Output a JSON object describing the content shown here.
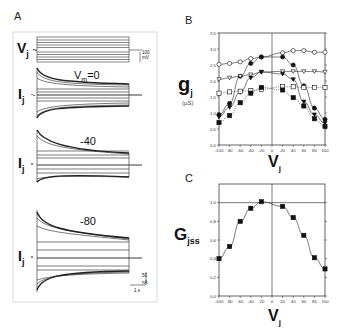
{
  "panels": {
    "A": {
      "letter": "A",
      "voltage_label": "V",
      "voltage_sub": "j",
      "current_label": "I",
      "current_sub": "j",
      "voltage_scale": {
        "value": "100",
        "unit": "mV"
      },
      "current_scale": {
        "value": "50",
        "unit": "nA"
      },
      "time_scale": "1 s",
      "traces": [
        {
          "vm_label": "V",
          "vm_sub": "m",
          "vm_value": "=0"
        },
        {
          "vm_value": "-40"
        },
        {
          "vm_value": "-80"
        }
      ]
    },
    "B": {
      "letter": "B",
      "ylabel_main": "g",
      "ylabel_sub": "j",
      "ylabel_unit": "(µS)",
      "xlabel_main": "V",
      "xlabel_sub": "j"
    },
    "C": {
      "letter": "C",
      "ylabel_main": "G",
      "ylabel_sub": "jss",
      "xlabel_main": "V",
      "xlabel_sub": "j"
    }
  },
  "chart_data": [
    {
      "panel": "A",
      "type": "line",
      "title": "Junctional current traces at Vm = 0, -40, -80 mV",
      "description": "Voltage step protocol (Vj) and resulting junctional current (Ij) families showing time-dependent decay at large transjunctional voltages",
      "annotations": [
        "Vm=0",
        "-40",
        "-80"
      ],
      "scale_bars": {
        "voltage": "100 mV",
        "current": "50 nA",
        "time": "1 s"
      }
    },
    {
      "panel": "B",
      "type": "scatter",
      "xlabel": "Vj",
      "ylabel": "gj (µS)",
      "xlim": [
        -100,
        100
      ],
      "ylim": [
        0.0,
        3.5
      ],
      "x_ticks": [
        -100,
        -80,
        -60,
        -40,
        -20,
        0,
        20,
        40,
        60,
        80,
        100
      ],
      "y_ticks": [
        "0,0",
        "0,5",
        "1,0",
        "1,5",
        "2,0",
        "2,5",
        "3,0",
        "3,5"
      ],
      "series": [
        {
          "name": "open circles (instantaneous)",
          "marker": "circle-open",
          "line": "solid",
          "x": [
            -100,
            -80,
            -60,
            -40,
            -20,
            20,
            40,
            60,
            80,
            100
          ],
          "y": [
            2.52,
            2.55,
            2.6,
            2.7,
            2.75,
            2.88,
            2.95,
            2.95,
            2.9,
            2.9
          ]
        },
        {
          "name": "filled circles (steady state)",
          "marker": "circle-filled",
          "line": "solid",
          "x": [
            -100,
            -80,
            -60,
            -40,
            -20,
            20,
            40,
            60,
            80,
            100
          ],
          "y": [
            0.95,
            1.3,
            2.15,
            2.55,
            2.75,
            2.75,
            2.5,
            1.85,
            1.15,
            0.8
          ]
        },
        {
          "name": "open triangles (instantaneous)",
          "marker": "triangle-open",
          "line": "solid",
          "x": [
            -100,
            -80,
            -60,
            -40,
            -20,
            20,
            40,
            60,
            80,
            100
          ],
          "y": [
            2.05,
            2.1,
            2.15,
            2.2,
            2.28,
            2.3,
            2.3,
            2.3,
            2.3,
            2.28
          ]
        },
        {
          "name": "filled triangles (steady state)",
          "marker": "triangle-filled",
          "line": "solid",
          "x": [
            -100,
            -80,
            -60,
            -40,
            -20,
            20,
            40,
            60,
            80,
            100
          ],
          "y": [
            0.88,
            1.18,
            1.65,
            2.1,
            2.28,
            2.22,
            2.05,
            1.35,
            0.95,
            0.68
          ]
        },
        {
          "name": "open squares (instantaneous)",
          "marker": "square-open",
          "line": "dotted",
          "x": [
            -100,
            -80,
            -60,
            -40,
            -20,
            20,
            40,
            60,
            80,
            100
          ],
          "y": [
            1.62,
            1.66,
            1.68,
            1.7,
            1.74,
            1.82,
            1.82,
            1.8,
            1.8,
            1.8
          ]
        },
        {
          "name": "filled squares (steady state)",
          "marker": "square-filled",
          "line": "dotted",
          "x": [
            -100,
            -80,
            -60,
            -40,
            -20,
            20,
            40,
            60,
            80,
            100
          ],
          "y": [
            0.7,
            0.92,
            1.32,
            1.62,
            1.8,
            1.72,
            1.48,
            1.22,
            0.82,
            0.58
          ]
        }
      ]
    },
    {
      "panel": "C",
      "type": "scatter",
      "xlabel": "Vj",
      "ylabel": "Gjss",
      "xlim": [
        -100,
        100
      ],
      "ylim": [
        0.0,
        1.2
      ],
      "x_ticks": [
        -100,
        -80,
        -60,
        -40,
        -20,
        0,
        20,
        40,
        60,
        80,
        100
      ],
      "y_ticks": [
        "0,0",
        "0,2",
        "0,4",
        "0,6",
        "0,8",
        "1,0"
      ],
      "reference_line": 1.0,
      "series": [
        {
          "name": "normalized steady-state conductance",
          "marker": "square-filled",
          "x": [
            -100,
            -80,
            -60,
            -40,
            -20,
            20,
            40,
            60,
            80,
            100
          ],
          "y": [
            0.4,
            0.53,
            0.8,
            0.94,
            1.01,
            0.96,
            0.84,
            0.65,
            0.41,
            0.29
          ]
        }
      ]
    }
  ]
}
